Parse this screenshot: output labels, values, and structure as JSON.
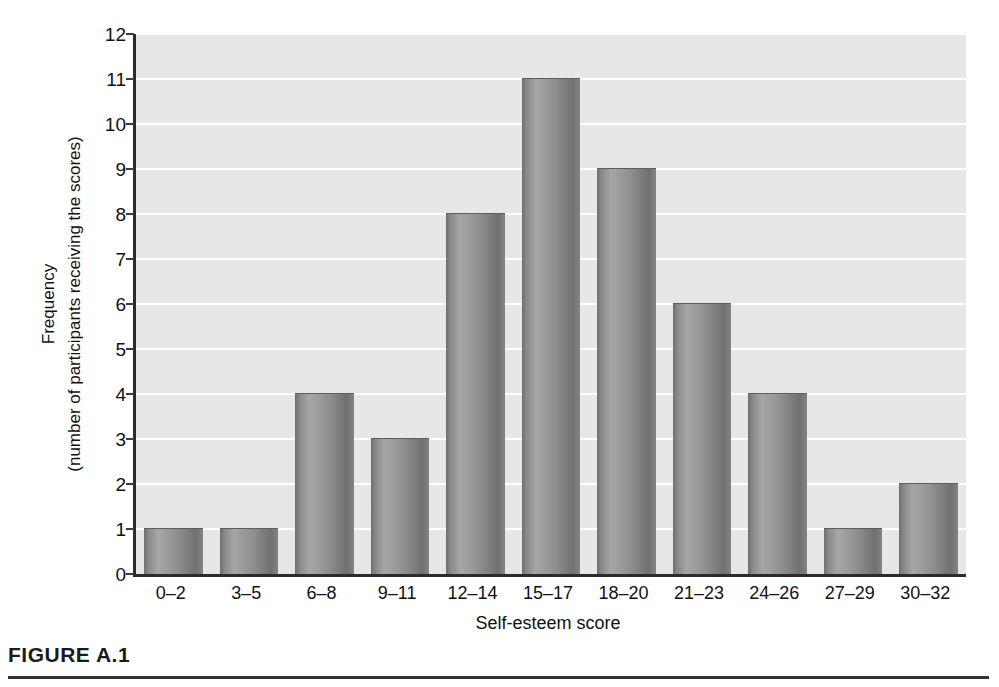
{
  "figure": {
    "caption": "FIGURE A.1"
  },
  "chart_data": {
    "type": "bar",
    "title": "",
    "categories": [
      "0–2",
      "3–5",
      "6–8",
      "9–11",
      "12–14",
      "15–17",
      "18–20",
      "21–23",
      "24–26",
      "27–29",
      "30–32"
    ],
    "values": [
      1,
      1,
      4,
      3,
      8,
      11,
      9,
      6,
      4,
      1,
      2
    ],
    "xlabel": "Self-esteem score",
    "ylabel_line1": "Frequency",
    "ylabel_line2": "(number of participants receiving the scores)",
    "ylim": [
      0,
      12
    ],
    "ytick_labels": [
      "0",
      "1",
      "2",
      "3",
      "4",
      "5",
      "6",
      "7",
      "8",
      "9",
      "10",
      "11",
      "12"
    ],
    "ytick_values": [
      0,
      1,
      2,
      3,
      4,
      5,
      6,
      7,
      8,
      9,
      10,
      11,
      12
    ],
    "grid": true,
    "legend": "none",
    "colors": {
      "plot_background": "#e7e7e7",
      "gridline": "#ffffff",
      "axis": "#2b2b2b",
      "bar_light": "#a6a6a6",
      "bar_dark": "#6e6e6e",
      "text": "#111111",
      "caption_rule": "#333333"
    }
  }
}
